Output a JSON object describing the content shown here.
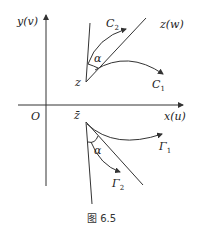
{
  "figure": {
    "caption": "图 6.5",
    "colors": {
      "stroke": "#222222",
      "background": "#ffffff"
    }
  },
  "axes": {
    "x_label": "x(u)",
    "y_label": "y(v)",
    "origin_label": "O"
  },
  "upper": {
    "plane_label": "z(w)",
    "point_label": "z",
    "angle_label": "α",
    "curve1_label": "C",
    "curve1_sub": "1",
    "curve2_label": "C",
    "curve2_sub": "2"
  },
  "lower": {
    "point_label": "z̄",
    "angle_label": "α",
    "curve1_label": "Γ",
    "curve1_sub": "1",
    "curve2_label": "Γ",
    "curve2_sub": "2"
  }
}
